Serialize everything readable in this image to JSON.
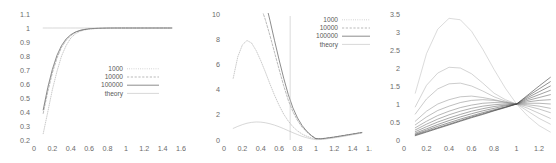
{
  "figure": {
    "background": "#ffffff",
    "panel_count": 3,
    "style": "gnuplot-grayscale-lineplot"
  },
  "legend_labels": [
    "1000",
    "10000",
    "100000",
    "theory"
  ],
  "legend_styles": [
    "fine-dotted",
    "dashed",
    "solid-dark",
    "solid-light"
  ],
  "legend_colors": [
    "#9a9a9a",
    "#8a8a8a",
    "#4a4a4a",
    "#b5b5b5"
  ],
  "chart_data": [
    {
      "type": "line",
      "panel": 1,
      "title": "",
      "xlabel": "",
      "ylabel": "",
      "xlim": [
        0,
        1.6
      ],
      "ylim": [
        0.2,
        1.1
      ],
      "xticks": [
        "0",
        "0.2",
        "0.4",
        "0.6",
        "0.8",
        "1",
        "1.2",
        "1.4",
        "1.6"
      ],
      "xtick_values": [
        0,
        0.2,
        0.4,
        0.6,
        0.8,
        1,
        1.2,
        1.4,
        1.6
      ],
      "yticks": [
        "0.2",
        "0.3",
        "0.4",
        "0.5",
        "0.6",
        "0.7",
        "0.8",
        "0.9",
        "1",
        "1.1"
      ],
      "ytick_values": [
        0.2,
        0.3,
        0.4,
        0.5,
        0.6,
        0.7,
        0.8,
        0.9,
        1.0,
        1.1
      ],
      "grid": false,
      "legend_position": "center-right-inside",
      "legend": [
        "1000",
        "10000",
        "100000",
        "theory"
      ],
      "x": [
        0.1,
        0.15,
        0.2,
        0.25,
        0.3,
        0.35,
        0.4,
        0.45,
        0.5,
        0.55,
        0.6,
        0.7,
        0.8,
        0.9,
        1.0,
        1.1,
        1.2,
        1.3,
        1.4,
        1.5
      ],
      "series": [
        {
          "name": "1000",
          "style": "fine-dotted",
          "values": [
            0.245,
            0.4,
            0.56,
            0.69,
            0.8,
            0.875,
            0.928,
            0.958,
            0.976,
            0.986,
            0.992,
            0.997,
            0.999,
            1.0,
            1.0,
            1.0,
            1.0,
            1.0,
            1.0,
            1.0
          ]
        },
        {
          "name": "10000",
          "style": "dashed",
          "values": [
            0.39,
            0.545,
            0.68,
            0.785,
            0.862,
            0.912,
            0.946,
            0.968,
            0.981,
            0.989,
            0.994,
            0.998,
            0.999,
            1.0,
            1.0,
            1.0,
            1.0,
            1.0,
            1.0,
            1.0
          ]
        },
        {
          "name": "100000",
          "style": "solid-dark",
          "values": [
            0.415,
            0.575,
            0.705,
            0.805,
            0.875,
            0.922,
            0.952,
            0.971,
            0.983,
            0.99,
            0.995,
            0.998,
            1.0,
            1.0,
            1.0,
            1.0,
            1.0,
            1.0,
            1.0,
            1.0
          ]
        },
        {
          "name": "theory",
          "style": "solid-light",
          "values": [
            1.0,
            1.0,
            1.0,
            1.0,
            1.0,
            1.0,
            1.0,
            1.0,
            1.0,
            1.0,
            1.0,
            1.0,
            1.0,
            1.0,
            1.0,
            1.0,
            1.0,
            1.0,
            1.0,
            1.0
          ]
        }
      ]
    },
    {
      "type": "line",
      "panel": 2,
      "title": "",
      "xlabel": "",
      "ylabel": "",
      "xlim": [
        0,
        1.6
      ],
      "ylim": [
        0,
        10
      ],
      "xticks": [
        "0",
        "0.2",
        "0.4",
        "0.6",
        "0.8",
        "1",
        "1.2",
        "1.4",
        "1.6"
      ],
      "xtick_values": [
        0,
        0.2,
        0.4,
        0.6,
        0.8,
        1,
        1.2,
        1.4,
        1.6
      ],
      "yticks": [
        "0",
        "2",
        "4",
        "6",
        "8",
        "10"
      ],
      "ytick_values": [
        0,
        2,
        4,
        6,
        8,
        10
      ],
      "grid": false,
      "legend_position": "top-right-outside",
      "legend": [
        "1000",
        "10000",
        "100000",
        "theory"
      ],
      "annotation": "vertical spike near x = 0.72 reaching top of axis",
      "spike_x": 0.72,
      "x": [
        0.1,
        0.15,
        0.2,
        0.25,
        0.3,
        0.35,
        0.4,
        0.45,
        0.5,
        0.55,
        0.6,
        0.65,
        0.7,
        0.75,
        0.8,
        0.85,
        0.9,
        0.95,
        1.0,
        1.05,
        1.1,
        1.2,
        1.3,
        1.4,
        1.5
      ],
      "series": [
        {
          "name": "1000",
          "style": "fine-dotted",
          "values": [
            4.9,
            6.6,
            7.55,
            7.9,
            7.7,
            7.1,
            6.3,
            5.4,
            4.45,
            3.55,
            2.75,
            2.05,
            1.5,
            1.05,
            0.72,
            0.47,
            0.3,
            0.17,
            0.08,
            0.07,
            0.1,
            0.2,
            0.32,
            0.45,
            0.58
          ]
        },
        {
          "name": "10000",
          "style": "dashed",
          "values": [
            11.0,
            11.6,
            12.0,
            12.1,
            11.9,
            11.4,
            10.6,
            9.55,
            8.3,
            6.95,
            5.6,
            4.3,
            3.15,
            2.25,
            1.55,
            1.02,
            0.64,
            0.34,
            0.12,
            0.1,
            0.14,
            0.24,
            0.36,
            0.48,
            0.6
          ]
        },
        {
          "name": "100000",
          "style": "solid-dark",
          "values": [
            13.5,
            14.0,
            14.3,
            14.3,
            14.0,
            13.3,
            12.3,
            11.0,
            9.5,
            7.9,
            6.35,
            4.9,
            3.6,
            2.55,
            1.75,
            1.15,
            0.7,
            0.36,
            0.1,
            0.09,
            0.13,
            0.23,
            0.35,
            0.47,
            0.59
          ]
        },
        {
          "name": "theory",
          "style": "solid-light",
          "values": [
            0.92,
            1.08,
            1.22,
            1.33,
            1.4,
            1.43,
            1.42,
            1.37,
            1.29,
            1.18,
            1.05,
            0.9,
            0.74,
            0.58,
            0.43,
            0.29,
            0.18,
            0.09,
            0.03,
            0.04,
            0.07,
            0.17,
            0.29,
            0.42,
            0.55
          ]
        }
      ]
    },
    {
      "type": "line",
      "panel": 3,
      "title": "",
      "xlabel": "",
      "ylabel": "",
      "xlim": [
        0,
        1.35
      ],
      "ylim": [
        0,
        3.5
      ],
      "xticks": [
        "0",
        "0.2",
        "0.4",
        "0.6",
        "0.8",
        "1",
        "1.2"
      ],
      "xtick_values": [
        0,
        0.2,
        0.4,
        0.6,
        0.8,
        1,
        1.2
      ],
      "yticks": [
        "0",
        "0.5",
        "1",
        "1.5",
        "2",
        "2.5",
        "3",
        "3.5"
      ],
      "ytick_values": [
        0,
        0.5,
        1.0,
        1.5,
        2.0,
        2.5,
        3.0,
        3.5
      ],
      "grid": false,
      "legend_position": "none",
      "annotation": "family of curves all crossing at (1, 1); cropped at right edge",
      "crossing_point": [
        1,
        1
      ],
      "x": [
        0.1,
        0.2,
        0.3,
        0.4,
        0.5,
        0.6,
        0.7,
        0.8,
        0.9,
        1.0,
        1.1,
        1.2,
        1.3
      ],
      "series": [
        {
          "name": "curve-1",
          "peak": 3.38,
          "values": [
            1.3,
            2.4,
            3.08,
            3.38,
            3.34,
            3.02,
            2.52,
            1.96,
            1.44,
            1.0,
            0.66,
            0.4,
            0.22
          ]
        },
        {
          "name": "curve-2",
          "peak": 2.02,
          "values": [
            0.92,
            1.52,
            1.86,
            2.02,
            2.0,
            1.84,
            1.58,
            1.3,
            1.12,
            1.0,
            0.8,
            0.6,
            0.44
          ]
        },
        {
          "name": "curve-3",
          "peak": 1.58,
          "values": [
            0.72,
            1.14,
            1.42,
            1.56,
            1.58,
            1.5,
            1.36,
            1.2,
            1.08,
            1.0,
            0.88,
            0.74,
            0.6
          ]
        },
        {
          "name": "curve-4",
          "peak": 1.22,
          "values": [
            0.52,
            0.8,
            1.0,
            1.12,
            1.2,
            1.22,
            1.18,
            1.12,
            1.05,
            1.0,
            0.94,
            0.86,
            0.76
          ]
        },
        {
          "name": "curve-5",
          "peak": 1.12,
          "values": [
            0.42,
            0.64,
            0.82,
            0.94,
            1.04,
            1.1,
            1.12,
            1.1,
            1.05,
            1.0,
            0.98,
            0.94,
            0.88
          ]
        },
        {
          "name": "curve-6",
          "peak": 1.05,
          "values": [
            0.34,
            0.52,
            0.68,
            0.8,
            0.9,
            0.97,
            1.02,
            1.04,
            1.03,
            1.0,
            1.02,
            1.02,
            1.0
          ]
        },
        {
          "name": "curve-7",
          "peak": 1.02,
          "values": [
            0.28,
            0.44,
            0.58,
            0.7,
            0.8,
            0.88,
            0.94,
            0.98,
            1.0,
            1.0,
            1.06,
            1.1,
            1.12
          ]
        },
        {
          "name": "curve-8",
          "peak": 1.0,
          "values": [
            0.23,
            0.37,
            0.5,
            0.61,
            0.71,
            0.8,
            0.87,
            0.93,
            0.97,
            1.0,
            1.1,
            1.18,
            1.26
          ]
        },
        {
          "name": "curve-9",
          "peak": 1.0,
          "values": [
            0.19,
            0.31,
            0.43,
            0.54,
            0.64,
            0.73,
            0.81,
            0.88,
            0.95,
            1.0,
            1.14,
            1.26,
            1.38
          ]
        },
        {
          "name": "curve-10",
          "peak": 1.0,
          "values": [
            0.16,
            0.27,
            0.38,
            0.48,
            0.58,
            0.67,
            0.76,
            0.84,
            0.92,
            1.0,
            1.18,
            1.34,
            1.5
          ]
        },
        {
          "name": "curve-11",
          "peak": 1.0,
          "values": [
            0.14,
            0.24,
            0.34,
            0.44,
            0.54,
            0.64,
            0.73,
            0.82,
            0.91,
            1.0,
            1.22,
            1.42,
            1.62
          ]
        },
        {
          "name": "curve-12",
          "peak": 1.0,
          "values": [
            0.12,
            0.22,
            0.32,
            0.42,
            0.52,
            0.62,
            0.71,
            0.81,
            0.9,
            1.0,
            1.25,
            1.5,
            1.74
          ]
        }
      ]
    }
  ]
}
